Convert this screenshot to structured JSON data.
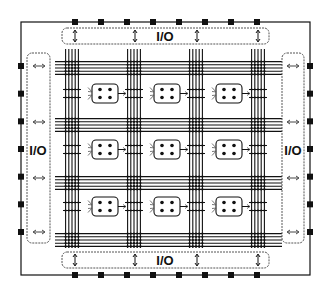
{
  "diagram": {
    "colors": {
      "line": "#111111",
      "io_border": "#555555",
      "background": "#ffffff"
    },
    "io_blocks": {
      "top": {
        "label": "I/O",
        "arrow": "vertical-double-arrow",
        "arrow_count": 4
      },
      "bottom": {
        "label": "I/O",
        "arrow": "vertical-double-arrow",
        "arrow_count": 4
      },
      "left": {
        "label": "I/O",
        "arrow": "horizontal-double-arrow",
        "arrow_count": 4
      },
      "right": {
        "label": "I/O",
        "arrow": "horizontal-double-arrow",
        "arrow_count": 4
      }
    },
    "pins": {
      "top": 8,
      "bottom": 8,
      "left": 7,
      "right": 7
    },
    "routing": {
      "vertical_channels": 4,
      "horizontal_channels": 4,
      "tracks_per_channel": 5
    },
    "logic_blocks": {
      "rows": 3,
      "cols": 3,
      "dots_per_block": 4
    }
  }
}
